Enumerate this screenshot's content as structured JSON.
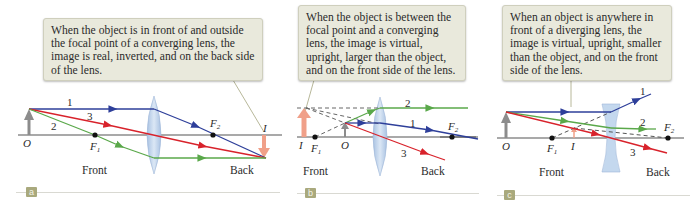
{
  "panels": [
    {
      "id": "a",
      "badge": "a",
      "callout": "When the object is in front of and outside the focal point of a converging lens, the image is real, inverted, and on the back side of the lens.",
      "lens_type": "converging",
      "labels": {
        "object": "O",
        "image": "I",
        "f1": "F",
        "f1_sub": "1",
        "f2": "F",
        "f2_sub": "2",
        "front": "Front",
        "back": "Back"
      },
      "ray_labels": [
        "1",
        "2",
        "3"
      ]
    },
    {
      "id": "b",
      "badge": "b",
      "callout": "When the object is between the focal point and a converging lens, the image is virtual, upright, larger than the object, and on the front side of the lens.",
      "lens_type": "converging",
      "labels": {
        "object": "O",
        "image": "I",
        "f1": "F",
        "f1_sub": "1",
        "f2": "F",
        "f2_sub": "2",
        "front": "Front",
        "back": "Back"
      },
      "ray_labels": [
        "1",
        "2",
        "3"
      ]
    },
    {
      "id": "c",
      "badge": "c",
      "callout": "When an object is anywhere in front of a diverging lens, the image is virtual, upright, smaller than the object, and on the front side of the lens.",
      "lens_type": "diverging",
      "labels": {
        "object": "O",
        "image": "I",
        "f1": "F",
        "f1_sub": "1",
        "f2": "F",
        "f2_sub": "2",
        "front": "Front",
        "back": "Back"
      },
      "ray_labels": [
        "1",
        "2",
        "3"
      ]
    }
  ],
  "colors": {
    "ray_1": "#2e3f9a",
    "ray_2": "#5aa84a",
    "ray_3": "#d8222b",
    "axis": "#555555",
    "object_arrow": "#8c8c8c",
    "image_arrow": "#f0a089",
    "lens_fill": "#b8cfe8",
    "callout_bg": "#e9e9dc",
    "badge_bg": "#a9a97d"
  }
}
